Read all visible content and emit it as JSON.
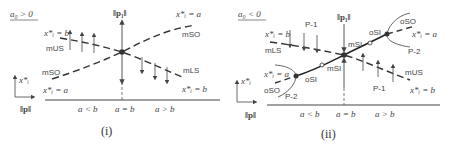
{
  "figure": {
    "panels": [
      {
        "id": "i",
        "caption": "(i)",
        "condition": "a₀ > 0",
        "vertical_axis_label": "‖p₁‖",
        "horizontal_axis_label": "‖p‖",
        "small_axis_label": "x*ᵢ",
        "ticks": [
          "a < b",
          "a = b",
          "a > b"
        ],
        "curves": [
          {
            "name": "mSO",
            "start_label": "x*ᵢ = a",
            "end_label": "x*ᵢ = a",
            "style": "dashed",
            "rises": true
          },
          {
            "name": "mUS",
            "start_label": "x*ᵢ = b",
            "style": "dashed",
            "arrows": "up"
          },
          {
            "name": "mLS",
            "end_label": "x*ᵢ = b",
            "style": "dashed",
            "arrows": "down"
          }
        ],
        "labels": {
          "top_left_curve": "x*ᵢ = b",
          "mUS": "mUS",
          "mSO_left": "mSO",
          "bottom_left_curve": "x*ᵢ = a",
          "top_right_curve": "x*ᵢ = a",
          "mSO_right": "mSO",
          "mLS": "mLS",
          "bottom_right_curve": "x*ᵢ = b"
        }
      },
      {
        "id": "ii",
        "caption": "(ii)",
        "condition": "a₀ < 0",
        "vertical_axis_label": "‖p₁‖",
        "horizontal_axis_label": "‖p‖",
        "small_axis_label": "x*ᵢ",
        "ticks": [
          "a < b",
          "a = b",
          "a > b"
        ],
        "labels": {
          "top_left_curve": "x*ᵢ = b",
          "mLS": "mLS",
          "p1_top": "P-1",
          "left_curve": "x*ᵢ = a",
          "oSO_left": "oSO",
          "p2_left": "P-2",
          "oSI_left": "oSI",
          "mSI_lower": "mSI",
          "mSI_upper": "mSI",
          "oSI_right": "oSI",
          "oSO_right": "oSO",
          "right_curve": "x*ᵢ = a",
          "p2_right": "P-2",
          "mUS": "mUS",
          "p1_bottom": "P-1",
          "bottom_right_curve": "x*ᵢ = b"
        }
      }
    ]
  }
}
